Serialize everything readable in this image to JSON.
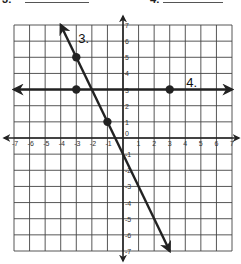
{
  "header": {
    "left_label": "3:",
    "right_label": "4:"
  },
  "graph": {
    "x_range": [
      -7,
      7
    ],
    "y_range": [
      -7,
      7
    ],
    "grid": true,
    "x_ticks": [
      "-7",
      "-6",
      "-5",
      "-4",
      "-3",
      "-2",
      "-1",
      "0",
      "1",
      "2",
      "3",
      "4",
      "5",
      "6",
      "7"
    ],
    "y_ticks": [
      "7",
      "6",
      "5",
      "4",
      "3",
      "2",
      "1",
      "-1",
      "-2",
      "-3",
      "-4",
      "-5",
      "-6",
      "-7"
    ],
    "lines": [
      {
        "label": "3.",
        "equation": "y = -2x - 1",
        "points": [
          [
            -3,
            5
          ],
          [
            -1,
            1
          ]
        ],
        "from": [
          -4,
          7
        ],
        "to": [
          3,
          -7
        ]
      },
      {
        "label": "4.",
        "equation": "y = 3",
        "points": [
          [
            -3,
            3
          ],
          [
            3,
            3
          ]
        ],
        "from": [
          -7,
          3
        ],
        "to": [
          7,
          3
        ]
      }
    ]
  },
  "colors": {
    "line": "#222222",
    "grid": "#444444",
    "background": "#ffffff"
  }
}
